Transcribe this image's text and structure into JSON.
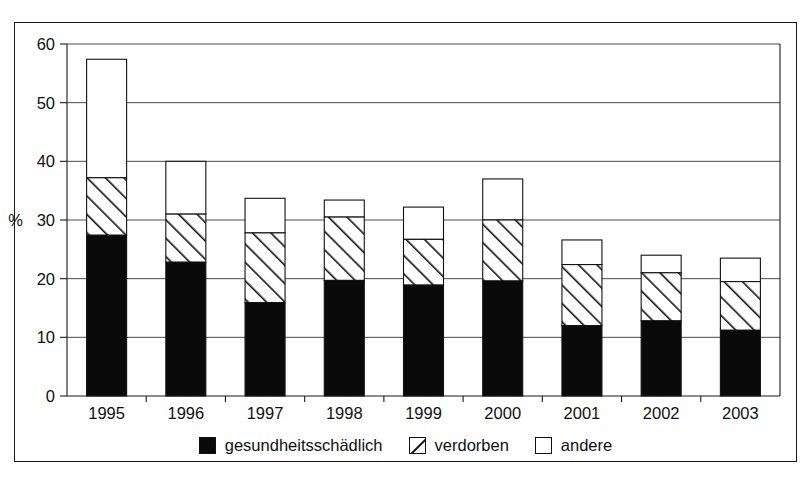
{
  "chart_data": {
    "type": "bar",
    "title": "",
    "subtitle": "",
    "stacked": true,
    "xlabel": "",
    "ylabel": "%",
    "ylim": [
      0,
      60
    ],
    "yticks": [
      0,
      10,
      20,
      30,
      40,
      50,
      60
    ],
    "ytick_labels": [
      "0",
      "10",
      "20",
      "30",
      "40",
      "50",
      "60"
    ],
    "grid": true,
    "legend_position": "bottom",
    "categories": [
      "1995",
      "1996",
      "1997",
      "1998",
      "1999",
      "2000",
      "2001",
      "2002",
      "2003"
    ],
    "series": [
      {
        "name": "gesundheitsschädlich",
        "pattern": "solid-black",
        "color": "#0a0a0a",
        "values": [
          27.4,
          22.8,
          15.9,
          19.7,
          18.9,
          19.6,
          12.0,
          12.8,
          11.2
        ]
      },
      {
        "name": "verdorben",
        "pattern": "diagonal-hatch",
        "color": "#ffffff",
        "values": [
          9.8,
          8.2,
          11.9,
          10.8,
          7.8,
          10.4,
          10.4,
          8.2,
          8.3
        ]
      },
      {
        "name": "andere",
        "pattern": "white",
        "color": "#ffffff",
        "values": [
          20.2,
          9.0,
          5.9,
          2.9,
          5.5,
          7.0,
          4.2,
          3.0,
          4.0
        ]
      }
    ],
    "cumulative_tops": {
      "gesundheitsschaedlich": [
        27.4,
        22.8,
        15.9,
        19.7,
        18.9,
        19.6,
        12.0,
        12.8,
        11.2
      ],
      "verdorben": [
        37.2,
        31.0,
        27.8,
        30.5,
        26.7,
        30.0,
        22.4,
        21.0,
        19.5
      ],
      "andere": [
        57.4,
        40.0,
        33.7,
        33.4,
        32.2,
        37.0,
        26.6,
        24.0,
        23.5
      ]
    },
    "totals": [
      57.4,
      40.0,
      33.7,
      33.4,
      32.2,
      37.0,
      26.6,
      24.0,
      23.5
    ]
  },
  "legend": {
    "items": [
      {
        "label": "gesundheitsschädlich",
        "swatch": "black"
      },
      {
        "label": "verdorben",
        "swatch": "hatch"
      },
      {
        "label": "andere",
        "swatch": "white"
      }
    ]
  },
  "colors": {
    "series_black": "#0a0a0a",
    "series_hatch": "#ffffff",
    "series_white": "#ffffff",
    "outline": "#111111",
    "grid": "#2a2a2a",
    "background": "#ffffff"
  }
}
